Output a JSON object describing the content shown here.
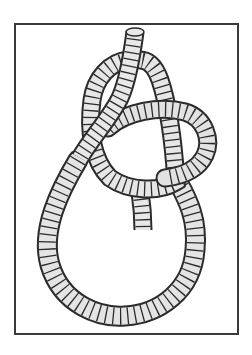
{
  "image": {
    "subject": "rope knot illustration",
    "description": "Pencil-style drawing of a bowline knot with a large loop, framed by a thin dark border",
    "colors": {
      "background": "#ffffff",
      "frame": "#3a3a3a",
      "rope_fill": "#e6e6e6",
      "rope_shade": "#bdbdbd",
      "rope_outline": "#2b2b2b"
    }
  }
}
